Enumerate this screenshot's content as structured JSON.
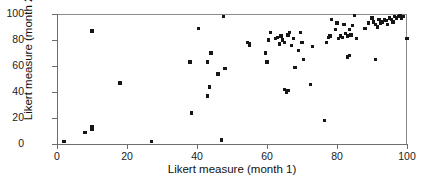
{
  "chart_data": {
    "type": "scatter",
    "title": "",
    "xlabel": "Likert measure (month 1)",
    "ylabel": "Likert measure (month 2)",
    "xlim": [
      0,
      100
    ],
    "ylim": [
      0,
      100
    ],
    "xticks": [
      0,
      20,
      40,
      60,
      80,
      100
    ],
    "yticks": [
      0,
      20,
      40,
      60,
      80,
      100
    ],
    "grid": false,
    "legend": null,
    "marker": {
      "shape": "square",
      "color": "#161616",
      "size": 3.4
    },
    "series": [
      {
        "name": "respondents",
        "points": [
          [
            2,
            2
          ],
          [
            8,
            9
          ],
          [
            10,
            11
          ],
          [
            10,
            13
          ],
          [
            10,
            87
          ],
          [
            18,
            47
          ],
          [
            27,
            2
          ],
          [
            38,
            63
          ],
          [
            38.5,
            24
          ],
          [
            40.5,
            89
          ],
          [
            43,
            37
          ],
          [
            43,
            63
          ],
          [
            43.5,
            44
          ],
          [
            44,
            70
          ],
          [
            46,
            54
          ],
          [
            47,
            3
          ],
          [
            47.5,
            98
          ],
          [
            48,
            58
          ],
          [
            54.5,
            78
          ],
          [
            55,
            76
          ],
          [
            55,
            77
          ],
          [
            59.5,
            70
          ],
          [
            60,
            63
          ],
          [
            60.5,
            80
          ],
          [
            61,
            86
          ],
          [
            62.5,
            81
          ],
          [
            63,
            82
          ],
          [
            63.5,
            77
          ],
          [
            64,
            83
          ],
          [
            64.5,
            80
          ],
          [
            65,
            78
          ],
          [
            65,
            42
          ],
          [
            65.5,
            40
          ],
          [
            66,
            41
          ],
          [
            66,
            84
          ],
          [
            66.5,
            86
          ],
          [
            67,
            76
          ],
          [
            67.5,
            81
          ],
          [
            68,
            59
          ],
          [
            69,
            72
          ],
          [
            69.5,
            86
          ],
          [
            70,
            78
          ],
          [
            70.5,
            65
          ],
          [
            72.5,
            46
          ],
          [
            73,
            75
          ],
          [
            76.5,
            18
          ],
          [
            77,
            78
          ],
          [
            77.5,
            82
          ],
          [
            78,
            83
          ],
          [
            78.5,
            96
          ],
          [
            79.5,
            88
          ],
          [
            80,
            93
          ],
          [
            80.5,
            81
          ],
          [
            81,
            83
          ],
          [
            81.5,
            82
          ],
          [
            82,
            92
          ],
          [
            82.5,
            85
          ],
          [
            83,
            83
          ],
          [
            83,
            67
          ],
          [
            83.5,
            68
          ],
          [
            83.5,
            88
          ],
          [
            84,
            84
          ],
          [
            84.5,
            91
          ],
          [
            85,
            99
          ],
          [
            85.5,
            81
          ],
          [
            88,
            89
          ],
          [
            89,
            93
          ],
          [
            90,
            97
          ],
          [
            90.5,
            94
          ],
          [
            91,
            92
          ],
          [
            91.5,
            90
          ],
          [
            92,
            96
          ],
          [
            92.5,
            93
          ],
          [
            93,
            94
          ],
          [
            93.5,
            96
          ],
          [
            94,
            95
          ],
          [
            94.5,
            92
          ],
          [
            95,
            97
          ],
          [
            95.5,
            96
          ],
          [
            96,
            94
          ],
          [
            96.5,
            98
          ],
          [
            97,
            97
          ],
          [
            97.5,
            98
          ],
          [
            98,
            99
          ],
          [
            98.5,
            97
          ],
          [
            99,
            98
          ],
          [
            91,
            65
          ],
          [
            100,
            81
          ]
        ]
      }
    ]
  }
}
